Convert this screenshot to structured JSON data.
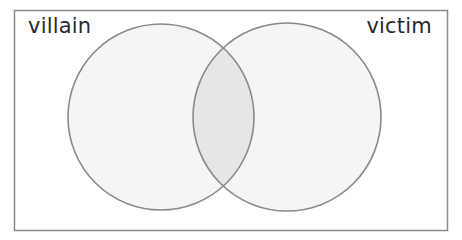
{
  "diagram": {
    "type": "venn",
    "sets": [
      {
        "label": "villain",
        "cx": 161,
        "cy": 117,
        "r": 93
      },
      {
        "label": "victim",
        "cx": 287,
        "cy": 117,
        "r": 94
      }
    ],
    "intersection_label": "",
    "colors": {
      "frame": "#8a8a8a",
      "circle_stroke": "#8a8a8a",
      "circle_fill": "#f5f5f5",
      "intersection_fill": "#e6e6e6",
      "text": "#2a2a2a"
    }
  }
}
